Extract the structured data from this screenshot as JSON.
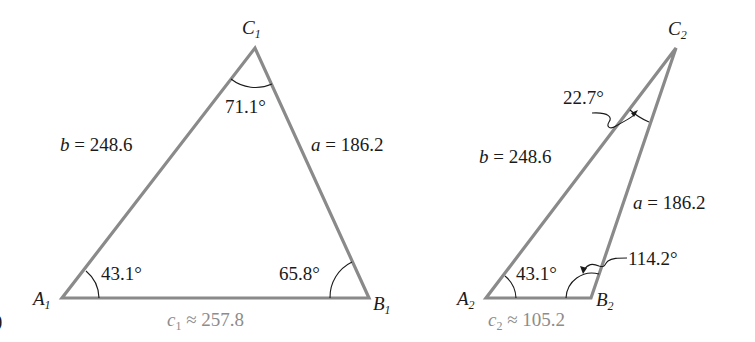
{
  "figure": {
    "part_marker": ")",
    "triangle_1": {
      "vertices": {
        "A": {
          "name": "A",
          "sub": "1",
          "x": 62,
          "y": 298
        },
        "B": {
          "name": "B",
          "sub": "1",
          "x": 369,
          "y": 298
        },
        "C": {
          "name": "C",
          "sub": "1",
          "x": 255,
          "y": 48
        }
      },
      "sides": {
        "b": {
          "var": "b",
          "text": "= 248.6"
        },
        "a": {
          "var": "a",
          "text": "= 186.2"
        },
        "c": {
          "var": "c",
          "sub": "1",
          "text": "≈ 257.8"
        }
      },
      "angles": {
        "A": "43.1°",
        "B": "65.8°",
        "C": "71.1°"
      }
    },
    "triangle_2": {
      "vertices": {
        "A": {
          "name": "A",
          "sub": "2",
          "x": 486,
          "y": 298
        },
        "B": {
          "name": "B",
          "sub": "2",
          "x": 591,
          "y": 298
        },
        "C": {
          "name": "C",
          "sub": "2",
          "x": 676,
          "y": 48
        }
      },
      "sides": {
        "b": {
          "var": "b",
          "text": "= 248.6"
        },
        "a": {
          "var": "a",
          "text": "= 186.2"
        },
        "c": {
          "var": "c",
          "sub": "2",
          "text": "≈ 105.2"
        }
      },
      "angles": {
        "A": "43.1°",
        "B": "114.2°",
        "C": "22.7°"
      }
    },
    "colors": {
      "side_stroke": "#8a8a8a",
      "text": "#1a1a1a",
      "approx_side_text": "#8c8c8c"
    }
  }
}
